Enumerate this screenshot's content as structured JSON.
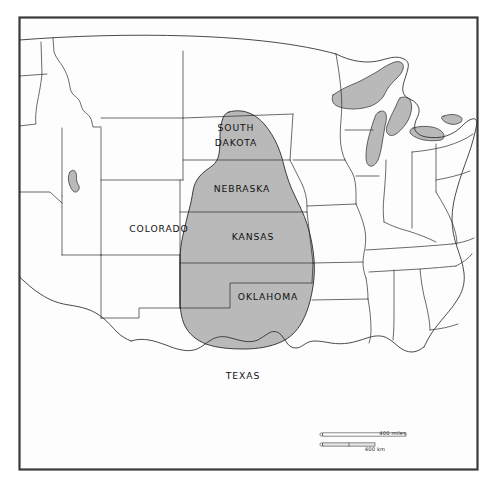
{
  "figure": {
    "kind": "thematic-outline-map",
    "region": "Central and Eastern United States",
    "width": 499,
    "height": 488,
    "background_color": "#ffffff",
    "frame_color": "#3a3a3a",
    "outline_color": "#2b2b2b",
    "shaded_fill_color": "#b9b9b9",
    "land_fill_color": "#fdfdfd"
  },
  "state_labels": [
    {
      "id": "south-dakota",
      "line1": "SOUTH",
      "line2": "DAKOTA",
      "x": 236,
      "y": 131
    },
    {
      "id": "nebraska",
      "line1": "NEBRASKA",
      "line2": "",
      "x": 242,
      "y": 192
    },
    {
      "id": "colorado",
      "line1": "COLORADO",
      "line2": "",
      "x": 159,
      "y": 232
    },
    {
      "id": "kansas",
      "line1": "KANSAS",
      "line2": "",
      "x": 253,
      "y": 240
    },
    {
      "id": "oklahoma",
      "line1": "OKLAHOMA",
      "line2": "",
      "x": 268,
      "y": 300
    },
    {
      "id": "texas",
      "line1": "TEXAS",
      "line2": "",
      "x": 243,
      "y": 379
    }
  ],
  "shaded_region": {
    "name": "High Plains Aquifer",
    "covers": [
      "South Dakota",
      "Nebraska",
      "Colorado",
      "Kansas",
      "Oklahoma",
      "Texas"
    ],
    "fill": "#b9b9b9"
  },
  "water_features": {
    "name": "Great Lakes",
    "fill": "#b9b9b9",
    "lakes": [
      "Lake Superior",
      "Lake Michigan",
      "Lake Huron",
      "Lake Erie",
      "Lake Ontario"
    ]
  },
  "scale_bar": {
    "miles_label": "400 miles",
    "km_label": "400 km",
    "miles_value": 400,
    "km_value": 400,
    "x": 320,
    "y": 434
  }
}
